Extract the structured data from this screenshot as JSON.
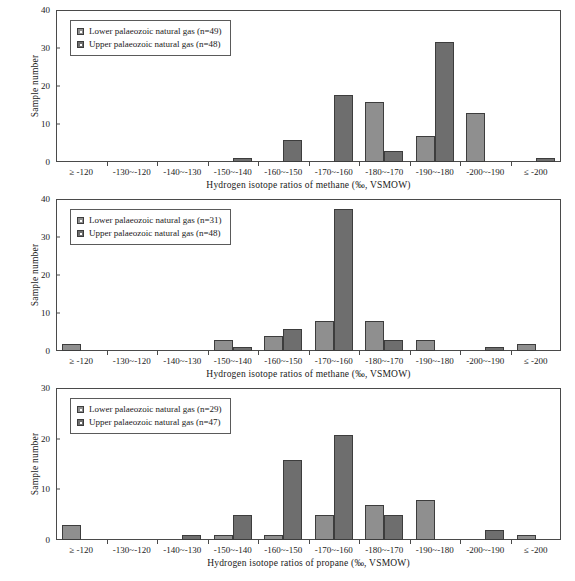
{
  "figure": {
    "panel_count": 3,
    "series_names": [
      "Lower palaeozoic natural gas",
      "Upper palaeozoic natural gas"
    ],
    "colors": {
      "lower": "#8f8f8f",
      "upper": "#6e6e6e",
      "axis": "#4a4a4a",
      "background": "#ffffff"
    }
  },
  "chart_data": [
    {
      "type": "bar",
      "title": "",
      "xlabel": "Hydrogen isotope ratios of methane (‰, VSMOW)",
      "ylabel": "Sample number",
      "ylim": [
        0,
        40
      ],
      "yticks": [
        0,
        10,
        20,
        30,
        40
      ],
      "grid": false,
      "legend_position": "top-left",
      "categories": [
        "≥ -120",
        "-130~-120",
        "-140~-130",
        "-150~-140",
        "-160~-150",
        "-170~-160",
        "-180~-170",
        "-190~-180",
        "-200~-190",
        "≤ -200"
      ],
      "series": [
        {
          "name": "Lower palaeozoic natural gas",
          "n": 49,
          "legend_label": "Lower palaeozoic natural gas (n=49)",
          "values": [
            0,
            0,
            0,
            0,
            0,
            0,
            16,
            7,
            13,
            0
          ]
        },
        {
          "name": "Upper palaeozoic natural gas",
          "n": 48,
          "legend_label": "Upper palaeozoic natural gas (n=48)",
          "values": [
            0,
            0,
            0,
            1,
            6,
            18,
            3,
            32,
            0,
            1
          ]
        }
      ]
    },
    {
      "type": "bar",
      "title": "",
      "xlabel": "Hydrogen isotope ratios of methane (‰, VSMOW)",
      "ylabel": "Sample number",
      "ylim": [
        0,
        40
      ],
      "yticks": [
        0,
        10,
        20,
        30,
        40
      ],
      "grid": false,
      "legend_position": "top-left",
      "categories": [
        "≥ -120",
        "-130~-120",
        "-140~-130",
        "-150~-140",
        "-160~-150",
        "-170~-160",
        "-180~-170",
        "-190~-180",
        "-200~-190",
        "≤ -200"
      ],
      "series": [
        {
          "name": "Lower palaeozoic natural gas",
          "n": 31,
          "legend_label": "Lower palaeozoic natural gas (n=31)",
          "values": [
            2,
            0,
            0,
            3,
            4,
            8,
            8,
            3,
            0,
            2
          ]
        },
        {
          "name": "Upper palaeozoic natural gas",
          "n": 48,
          "legend_label": "Upper palaeozoic natural gas (n=48)",
          "values": [
            0,
            0,
            0,
            1,
            6,
            38,
            3,
            0,
            1,
            0
          ]
        }
      ]
    },
    {
      "type": "bar",
      "title": "",
      "xlabel": "Hydrogen isotope ratios of propane (‰, VSMOW)",
      "ylabel": "Sample number",
      "ylim": [
        0,
        30
      ],
      "yticks": [
        0,
        10,
        20,
        30
      ],
      "grid": false,
      "legend_position": "top-left",
      "categories": [
        "≥ -120",
        "-130~-120",
        "-140~-130",
        "-150~-140",
        "-160~-150",
        "-170~-160",
        "-180~-170",
        "-190~-180",
        "-200~-190",
        "≤ -200"
      ],
      "series": [
        {
          "name": "Lower palaeozoic natural gas",
          "n": 29,
          "legend_label": "Lower palaeozoic natural gas (n=29)",
          "values": [
            3,
            0,
            0,
            1,
            1,
            5,
            7,
            8,
            0,
            1
          ]
        },
        {
          "name": "Upper palaeozoic natural gas",
          "n": 47,
          "legend_label": "Upper palaeozoic natural gas (n=47)",
          "values": [
            0,
            0,
            1,
            5,
            16,
            21,
            5,
            0,
            2,
            0
          ]
        }
      ]
    }
  ]
}
